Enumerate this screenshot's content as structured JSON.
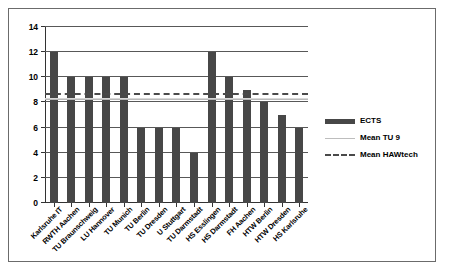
{
  "chart_data": {
    "type": "bar",
    "title": "",
    "xlabel": "",
    "ylabel": "",
    "ylim": [
      0,
      14
    ],
    "yticks": [
      0,
      2,
      4,
      6,
      8,
      10,
      12,
      14
    ],
    "grid": true,
    "legend_position": "right",
    "categories": [
      "Karlsruhe IT",
      "RWTH Aachen",
      "TU Braunschweig",
      "LU Hannover",
      "TU Munich",
      "TU Berlin",
      "TU Dresden",
      "U Stuttgart",
      "TU Darmstadt",
      "HS Esslingen",
      "HS Darmstadt",
      "FH Aachen",
      "HTW Berlin",
      "HTW Dresden",
      "HS Karlsruhe"
    ],
    "series": [
      {
        "name": "ECTS",
        "color": "#474747",
        "values": [
          12,
          10,
          10,
          10,
          10,
          6,
          6,
          6,
          4,
          12,
          10,
          9,
          8,
          7,
          6
        ]
      }
    ],
    "reference_lines": [
      {
        "name": "Mean TU 9",
        "value": 8.2,
        "style": "solid",
        "color": "#bdbdbd"
      },
      {
        "name": "Mean HAWtech",
        "value": 8.6,
        "style": "dashed",
        "color": "#4a4a4a"
      }
    ],
    "legend": [
      {
        "label": "ECTS",
        "key": "bar-swatch"
      },
      {
        "label": "Mean TU 9",
        "key": "solid-line-swatch"
      },
      {
        "label": "Mean HAWtech",
        "key": "dashed-line-swatch"
      }
    ]
  }
}
